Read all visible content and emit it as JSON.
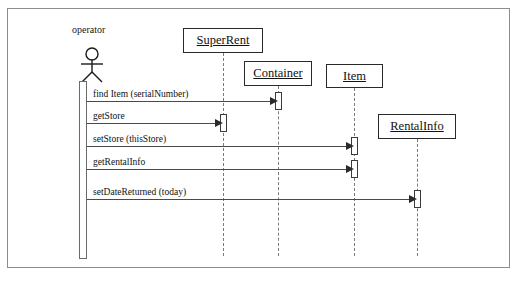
{
  "diagram": {
    "actor": {
      "label": "operator",
      "icon": "stick-figure-actor-icon"
    },
    "participants": [
      {
        "name": "SuperRent",
        "x": 182,
        "y": 27,
        "w": 80,
        "h": 25,
        "lifeline_x": 222,
        "lifeline_bottom": 255
      },
      {
        "name": "Container",
        "x": 243,
        "y": 60,
        "w": 68,
        "h": 25,
        "lifeline_x": 277,
        "lifeline_bottom": 255
      },
      {
        "name": "Item",
        "x": 325,
        "y": 63,
        "w": 57,
        "h": 24,
        "lifeline_x": 353,
        "lifeline_bottom": 255
      },
      {
        "name": "RentalInfo",
        "x": 377,
        "y": 113,
        "w": 78,
        "h": 25,
        "lifeline_x": 416,
        "lifeline_bottom": 255
      }
    ],
    "messages": [
      {
        "label": "find Item (serialNumber)",
        "from_x": 86,
        "to_x": 277,
        "y": 100,
        "label_x": 92,
        "label_y": 88
      },
      {
        "label": "getStore",
        "from_x": 86,
        "to_x": 222,
        "y": 122,
        "label_x": 92,
        "label_y": 110
      },
      {
        "label": "setStore (thisStore)",
        "from_x": 86,
        "to_x": 353,
        "y": 145,
        "label_x": 92,
        "label_y": 133
      },
      {
        "label": "getRentalInfo",
        "from_x": 86,
        "to_x": 353,
        "y": 168,
        "label_x": 92,
        "label_y": 156
      },
      {
        "label": "setDateReturned (today)",
        "from_x": 86,
        "to_x": 416,
        "y": 198,
        "label_x": 92,
        "label_y": 186
      }
    ],
    "activations": [
      {
        "owner": "operator",
        "x": 78,
        "y": 80,
        "w": 8,
        "h": 178
      },
      {
        "owner": "Container",
        "x": 274,
        "y": 91,
        "w": 7,
        "h": 18
      },
      {
        "owner": "SuperRent",
        "x": 219,
        "y": 113,
        "w": 7,
        "h": 18
      },
      {
        "owner": "Item",
        "x": 350,
        "y": 136,
        "w": 7,
        "h": 18
      },
      {
        "owner": "Item",
        "x": 350,
        "y": 159,
        "w": 7,
        "h": 18
      },
      {
        "owner": "RentalInfo",
        "x": 413,
        "y": 189,
        "w": 7,
        "h": 18
      }
    ],
    "colors": {
      "frame_border": "#8d8d8d",
      "box_border": "#2a2a2a",
      "lifeline": "#7a7a7a",
      "message_line": "#4a4a4a",
      "text": "#111111",
      "background": "#ffffff"
    }
  }
}
